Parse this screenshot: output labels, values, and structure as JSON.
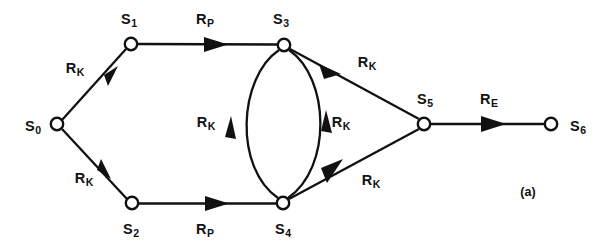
{
  "figure": {
    "caption": "(a)",
    "width": 607,
    "height": 248,
    "background": "#ffffff",
    "ink_color": "#111111"
  },
  "diagram": {
    "type": "state-transition-graph",
    "node_radius": 6.2,
    "nodes": [
      {
        "id": "S0",
        "label": "S",
        "sub": "0",
        "x": 57,
        "y": 124,
        "label_x": 33,
        "label_y": 126
      },
      {
        "id": "S1",
        "label": "S",
        "sub": "1",
        "x": 131,
        "y": 44,
        "label_x": 129,
        "label_y": 19
      },
      {
        "id": "S2",
        "label": "S",
        "sub": "2",
        "x": 132,
        "y": 203,
        "label_x": 131,
        "label_y": 229
      },
      {
        "id": "S3",
        "label": "S",
        "sub": "3",
        "x": 284,
        "y": 45,
        "label_x": 281,
        "label_y": 19
      },
      {
        "id": "S4",
        "label": "S",
        "sub": "4",
        "x": 283,
        "y": 203,
        "label_x": 283,
        "label_y": 229
      },
      {
        "id": "S5",
        "label": "S",
        "sub": "5",
        "x": 424,
        "y": 124,
        "label_x": 425,
        "label_y": 99
      },
      {
        "id": "S6",
        "label": "S",
        "sub": "6",
        "x": 551,
        "y": 124,
        "label_x": 578,
        "label_y": 126
      }
    ],
    "edges": [
      {
        "id": "e-s0-s1",
        "from": "S0",
        "to": "S1",
        "shape": "line",
        "label": "R",
        "sub": "K",
        "label_x": 75,
        "label_y": 68
      },
      {
        "id": "e-s0-s2",
        "from": "S0",
        "to": "S2",
        "shape": "line",
        "label": "R",
        "sub": "K",
        "label_x": 84,
        "label_y": 178
      },
      {
        "id": "e-s1-s3",
        "from": "S1",
        "to": "S3",
        "shape": "line",
        "label": "R",
        "sub": "P",
        "label_x": 205,
        "label_y": 19
      },
      {
        "id": "e-s2-s4",
        "from": "S2",
        "to": "S4",
        "shape": "line",
        "label": "R",
        "sub": "P",
        "label_x": 205,
        "label_y": 229
      },
      {
        "id": "e-s4-s3-arc",
        "from": "S4",
        "to": "S3",
        "shape": "arc-left",
        "label": "R",
        "sub": "K",
        "label_x": 206,
        "label_y": 122
      },
      {
        "id": "e-s3-s4-arc",
        "from": "S3",
        "to": "S4",
        "shape": "arc-right",
        "label": "R",
        "sub": "K",
        "label_x": 341,
        "label_y": 122
      },
      {
        "id": "e-s5-s3",
        "from": "S5",
        "to": "S3",
        "shape": "line",
        "label": "R",
        "sub": "K",
        "label_x": 367,
        "label_y": 62
      },
      {
        "id": "e-s5-s4",
        "from": "S5",
        "to": "S4",
        "shape": "line",
        "label": "R",
        "sub": "K",
        "label_x": 371,
        "label_y": 180
      },
      {
        "id": "e-s5-s6",
        "from": "S5",
        "to": "S6",
        "shape": "line",
        "label": "R",
        "sub": "E",
        "label_x": 489,
        "label_y": 99
      }
    ],
    "caption_x": 528,
    "caption_y": 192
  }
}
